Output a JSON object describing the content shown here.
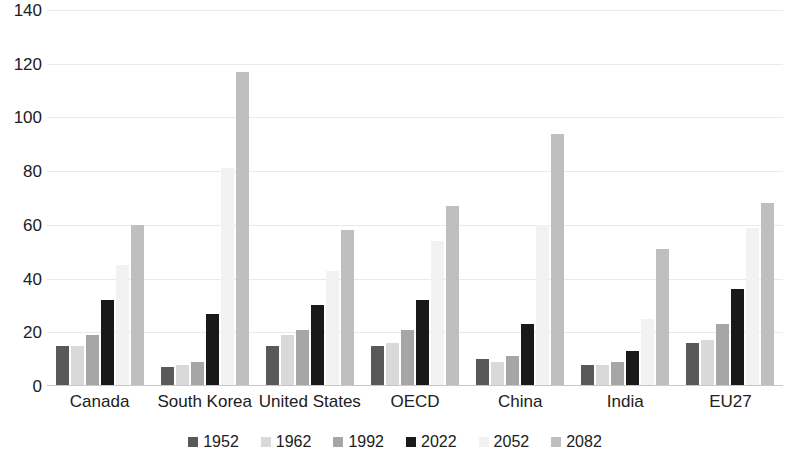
{
  "chart_data": {
    "type": "bar",
    "title": "",
    "subtitle": "",
    "xlabel": "",
    "ylabel": "",
    "ylim": [
      0,
      140
    ],
    "y_ticks": [
      0,
      20,
      40,
      60,
      80,
      100,
      120,
      140
    ],
    "grid": true,
    "legend_position": "bottom",
    "categories": [
      "Canada",
      "South Korea",
      "United States",
      "OECD",
      "China",
      "India",
      "EU27"
    ],
    "series": [
      {
        "name": "1952",
        "color": "#595959",
        "values": [
          15,
          7,
          15,
          15,
          10,
          8,
          16
        ]
      },
      {
        "name": "1962",
        "color": "#d9d9d9",
        "values": [
          15,
          8,
          19,
          16,
          9,
          8,
          17
        ]
      },
      {
        "name": "1992",
        "color": "#a6a6a6",
        "values": [
          19,
          9,
          21,
          21,
          11,
          9,
          23
        ]
      },
      {
        "name": "2022",
        "color": "#191919",
        "values": [
          32,
          27,
          30,
          32,
          23,
          13,
          36
        ]
      },
      {
        "name": "2052",
        "color": "#f2f2f2",
        "values": [
          45,
          81,
          43,
          54,
          60,
          25,
          59
        ]
      },
      {
        "name": "2082",
        "color": "#bfbfbf",
        "values": [
          60,
          117,
          58,
          67,
          94,
          51,
          68
        ]
      }
    ]
  },
  "axis": {
    "y_tick_labels": [
      "0",
      "20",
      "40",
      "60",
      "80",
      "100",
      "120",
      "140"
    ]
  },
  "legend": {
    "items": [
      {
        "label": "1952"
      },
      {
        "label": "1962"
      },
      {
        "label": "1992"
      },
      {
        "label": "2022"
      },
      {
        "label": "2052"
      },
      {
        "label": "2082"
      }
    ]
  }
}
